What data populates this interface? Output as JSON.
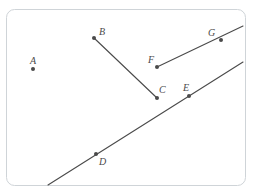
{
  "figure": {
    "kind": "geometry-diagram",
    "canvas": {
      "width": 253,
      "height": 194,
      "background": "#ffffff"
    },
    "frame": {
      "name": "rounded-border",
      "x": 6,
      "y": 9,
      "width": 240,
      "height": 177,
      "radius": 8,
      "stroke": "#cfd4d8",
      "stroke_width": 1
    },
    "style": {
      "point_color": "#4a4a4a",
      "point_radius": 2,
      "line_color": "#4a4a4a",
      "line_width": 1.1,
      "label_color": "#4a4a4a",
      "label_font_size": 10
    },
    "points": [
      {
        "id": "A",
        "label": "A",
        "x": 33,
        "y": 69,
        "label_x": 30,
        "label_y": 56
      },
      {
        "id": "B",
        "label": "B",
        "x": 94,
        "y": 38,
        "label_x": 99,
        "label_y": 27
      },
      {
        "id": "C",
        "label": "C",
        "x": 157,
        "y": 98,
        "label_x": 159,
        "label_y": 85
      },
      {
        "id": "D",
        "label": "D",
        "x": 96,
        "y": 154,
        "label_x": 99,
        "label_y": 157
      },
      {
        "id": "E",
        "label": "E",
        "x": 189,
        "y": 96,
        "label_x": 183,
        "label_y": 83
      },
      {
        "id": "F",
        "label": "F",
        "x": 157,
        "y": 67,
        "label_x": 148,
        "label_y": 55
      },
      {
        "id": "G",
        "label": "G",
        "x": 221,
        "y": 40,
        "label_x": 208,
        "label_y": 28
      }
    ],
    "shapes": [
      {
        "id": "segment-BC",
        "kind": "segment",
        "endpoints": [
          "B",
          "C"
        ],
        "x1": 94,
        "y1": 38,
        "x2": 157,
        "y2": 98
      },
      {
        "id": "ray-FG",
        "kind": "ray",
        "endpoints": [
          "F",
          "G"
        ],
        "x1": 157,
        "y1": 67,
        "x2": 243,
        "y2": 26
      },
      {
        "id": "line-DE",
        "kind": "line",
        "endpoints": [
          "D",
          "E"
        ],
        "x1": 48,
        "y1": 185,
        "x2": 243,
        "y2": 62
      }
    ]
  }
}
